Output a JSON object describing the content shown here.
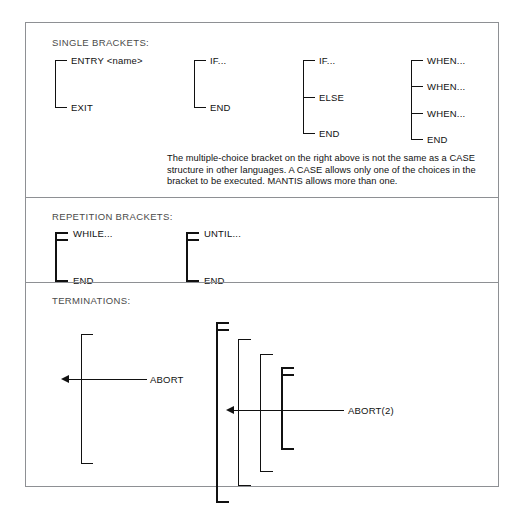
{
  "figure": {
    "sections": [
      {
        "id": "single",
        "title": "SINGLE BRACKETS:",
        "brackets": [
          {
            "name": "entry-exit",
            "labels": [
              "ENTRY <name>",
              "EXIT"
            ]
          },
          {
            "name": "if-end",
            "labels": [
              "IF...",
              "END"
            ]
          },
          {
            "name": "if-else-end",
            "labels": [
              "IF...",
              "ELSE",
              "END"
            ]
          },
          {
            "name": "when-when-when-end",
            "labels": [
              "WHEN...",
              "WHEN...",
              "WHEN...",
              "END"
            ]
          }
        ],
        "note": "The multiple-choice bracket on the right above is not the same as a CASE\nstructure in other languages. A CASE allows only one of the choices in the\nbracket to be executed. MANTIS allows more than one."
      },
      {
        "id": "repetition",
        "title": "REPETITION BRACKETS:",
        "brackets": [
          {
            "name": "while-end",
            "labels": [
              "WHILE...",
              "END"
            ]
          },
          {
            "name": "until-end",
            "labels": [
              "UNTIL...",
              "END"
            ]
          }
        ]
      },
      {
        "id": "terminations",
        "title": "TERMINATIONS:",
        "labels": {
          "abort": "ABORT",
          "abort2": "ABORT(2)"
        }
      }
    ]
  },
  "colors": {
    "ink": "#111111",
    "frame": "#8e9094",
    "section_label": "#4a4a4a",
    "background": "#ffffff"
  }
}
